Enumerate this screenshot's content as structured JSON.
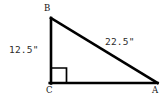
{
  "figure": {
    "kind": "right-triangle-diagram",
    "background_color": "#ffffff",
    "stroke_color": "#000000",
    "text_color": "#2b2b2b",
    "vertices": [
      {
        "name": "B",
        "label": "B",
        "x": 51,
        "y": 18
      },
      {
        "name": "C",
        "label": "C",
        "x": 51,
        "y": 83
      },
      {
        "name": "A",
        "label": "A",
        "x": 157,
        "y": 83
      }
    ],
    "sides": [
      {
        "name": "BC",
        "role": "vertical-leg",
        "label": "12.5\"",
        "from": "B",
        "to": "C"
      },
      {
        "name": "CA",
        "role": "horizontal-leg",
        "label": "",
        "from": "C",
        "to": "A"
      },
      {
        "name": "AB",
        "role": "hypotenuse",
        "label": "22.5\"",
        "from": "A",
        "to": "B"
      }
    ],
    "right_angle": {
      "at_vertex": "C",
      "marker": "square",
      "size": 15
    },
    "measurements": {
      "leg_bc": "12.5\"",
      "hypotenuse_ab": "22.5\""
    }
  }
}
